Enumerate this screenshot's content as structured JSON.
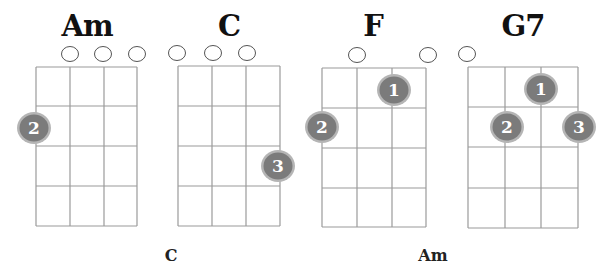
{
  "colors": {
    "grid_line": "#9a9a9a",
    "open_string_stroke": "#555555",
    "dot_fill": "#7b7b7b",
    "dot_ring": "#b5b5b5",
    "dot_text": "#ffffff",
    "title_text": "#111111"
  },
  "chords": [
    {
      "name": "Am",
      "title_x": 87,
      "grid": {
        "x": [
          36,
          70,
          104,
          137
        ],
        "y": [
          67,
          106,
          146,
          186,
          226
        ]
      },
      "open_strings": [
        {
          "x": 70,
          "y": 54
        },
        {
          "x": 103,
          "y": 54
        },
        {
          "x": 137,
          "y": 54
        }
      ],
      "fingers": [
        {
          "label": "2",
          "x": 34,
          "y": 128
        }
      ]
    },
    {
      "name": "C",
      "title_x": 229,
      "grid": {
        "x": [
          178,
          212,
          246,
          280
        ],
        "y": [
          66,
          106,
          146,
          186,
          226
        ]
      },
      "open_strings": [
        {
          "x": 177,
          "y": 53
        },
        {
          "x": 213,
          "y": 53
        },
        {
          "x": 247,
          "y": 53
        }
      ],
      "fingers": [
        {
          "label": "3",
          "x": 278,
          "y": 166
        }
      ]
    },
    {
      "name": "F",
      "title_x": 373,
      "grid": {
        "x": [
          322,
          357,
          392,
          426
        ],
        "y": [
          68,
          108,
          148,
          188,
          227
        ]
      },
      "open_strings": [
        {
          "x": 357,
          "y": 55
        },
        {
          "x": 428,
          "y": 55
        }
      ],
      "fingers": [
        {
          "label": "1",
          "x": 394,
          "y": 90
        },
        {
          "label": "2",
          "x": 322,
          "y": 127
        }
      ]
    },
    {
      "name": "G7",
      "title_x": 523,
      "grid": {
        "x": [
          468,
          505,
          541,
          578
        ],
        "y": [
          67,
          107,
          147,
          188,
          228
        ]
      },
      "open_strings": [
        {
          "x": 467,
          "y": 54
        }
      ],
      "fingers": [
        {
          "label": "1",
          "x": 541,
          "y": 89
        },
        {
          "label": "2",
          "x": 507,
          "y": 127
        },
        {
          "label": "3",
          "x": 579,
          "y": 127
        }
      ]
    }
  ],
  "bottom_labels": [
    {
      "text": "C",
      "x": 171
    },
    {
      "text": "Am",
      "x": 433
    }
  ]
}
